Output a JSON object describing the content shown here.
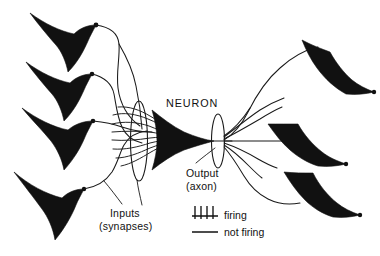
{
  "figure": {
    "title_label": "NEURON",
    "background_color": "#ffffff",
    "ink_color": "#111111",
    "width": 380,
    "height": 256
  },
  "annotations": {
    "neuron": "NEURON",
    "output_line1": "Output",
    "output_line2": "(axon)",
    "inputs_line1": "Inputs",
    "inputs_line2": "(synapses)"
  },
  "legend": {
    "firing_label": "firing",
    "not_firing_label": "not firing",
    "firing_icon": "spike-train-icon",
    "not_firing_icon": "flat-line-icon"
  },
  "structures": {
    "input_neuron_count": 4,
    "output_neuron_count": 3,
    "central_neuron": "pyramidal-cell",
    "dendrite_bundle": "input-synapse-bundle",
    "axon_bundle": "output-axon-bundle"
  }
}
